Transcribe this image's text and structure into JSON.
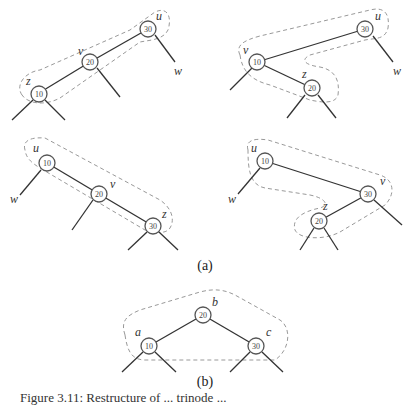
{
  "figure": {
    "subfigure_labels": {
      "a": "(a)",
      "b": "(b)"
    },
    "panels": [
      {
        "id": "a1",
        "nodes": [
          {
            "key": "30",
            "label": "u"
          },
          {
            "key": "20",
            "label": "v"
          },
          {
            "key": "10",
            "label": "z"
          }
        ],
        "extra_label": "w"
      },
      {
        "id": "a2",
        "nodes": [
          {
            "key": "30",
            "label": "u"
          },
          {
            "key": "10",
            "label": "v"
          },
          {
            "key": "20",
            "label": "z"
          }
        ],
        "extra_label": "w"
      },
      {
        "id": "a3",
        "nodes": [
          {
            "key": "10",
            "label": "u"
          },
          {
            "key": "20",
            "label": "v"
          },
          {
            "key": "30",
            "label": "z"
          }
        ],
        "extra_label": "w"
      },
      {
        "id": "a4",
        "nodes": [
          {
            "key": "10",
            "label": "u"
          },
          {
            "key": "30",
            "label": "v"
          },
          {
            "key": "20",
            "label": "z"
          }
        ],
        "extra_label": "w"
      },
      {
        "id": "b",
        "nodes": [
          {
            "key": "20",
            "label": "b"
          },
          {
            "key": "10",
            "label": "a"
          },
          {
            "key": "30",
            "label": "c"
          }
        ]
      }
    ],
    "caption_partial": "Figure 3.11: Restructure of ... trinode ..."
  }
}
